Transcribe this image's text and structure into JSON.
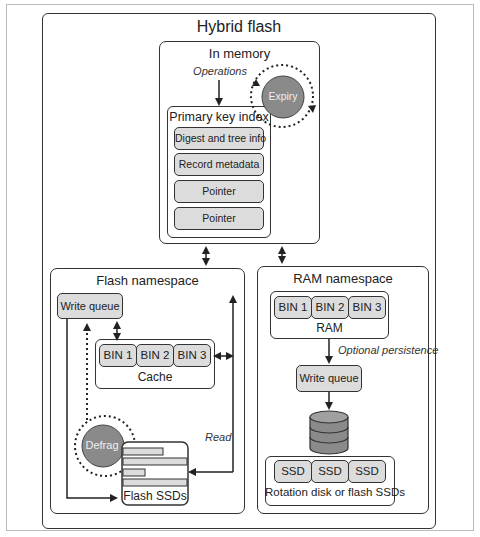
{
  "title": "Hybrid flash",
  "in_memory": {
    "title": "In memory",
    "operations_label": "Operations",
    "expiry_label": "Expiry",
    "primary_key_index": {
      "title": "Primary key index",
      "items": [
        "Digest and tree info",
        "Record metadata",
        "Pointer",
        "Pointer"
      ]
    }
  },
  "flash_namespace": {
    "title": "Flash namespace",
    "write_queue_label": "Write queue",
    "cache": {
      "label": "Cache",
      "bins": [
        "BIN 1",
        "BIN 2",
        "BIN 3"
      ]
    },
    "defrag_label": "Defrag",
    "read_label": "Read",
    "flash_ssds_label": "Flash SSDs"
  },
  "ram_namespace": {
    "title": "RAM namespace",
    "ram": {
      "label": "RAM",
      "bins": [
        "BIN 1",
        "BIN 2",
        "BIN 3"
      ]
    },
    "optional_persistence_label": "Optional persistence",
    "write_queue_label": "Write queue",
    "storage": {
      "label": "Rotation disk or flash SSDs",
      "ssds": [
        "SSD",
        "SSD",
        "SSD"
      ]
    }
  },
  "colors": {
    "circle": "#8a8a8a",
    "box_fill": "#dcdcdc",
    "stroke": "#333333"
  }
}
